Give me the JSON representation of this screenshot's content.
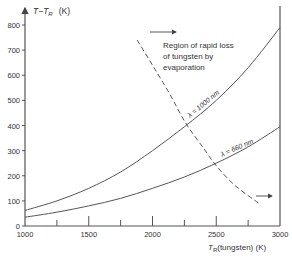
{
  "chart_data": {
    "type": "line",
    "title": "",
    "xlabel": "T_R (tungsten) (K)",
    "ylabel": "T − T_R (K)",
    "xlim": [
      1000,
      3000
    ],
    "ylim": [
      0,
      850
    ],
    "x_ticks": [
      1000,
      1500,
      2000,
      2500,
      3000
    ],
    "x_minor_ticks": [
      1250,
      1750,
      2250,
      2750
    ],
    "y_ticks": [
      0,
      100,
      200,
      300,
      400,
      500,
      600,
      700,
      800
    ],
    "grid": false,
    "series": [
      {
        "name": "λ = 1000 nm",
        "style": "solid",
        "x": [
          1000,
          1250,
          1500,
          1750,
          2000,
          2250,
          2500,
          2750,
          3000
        ],
        "y": [
          62,
          100,
          150,
          215,
          300,
          395,
          500,
          630,
          790
        ]
      },
      {
        "name": "λ = 660 nm",
        "style": "solid",
        "x": [
          1000,
          1250,
          1500,
          1750,
          2000,
          2250,
          2500,
          2750,
          3000
        ],
        "y": [
          35,
          55,
          80,
          110,
          150,
          195,
          250,
          315,
          395
        ]
      },
      {
        "name": "evaporation boundary",
        "style": "dashed",
        "x": [
          1880,
          2000,
          2130,
          2260,
          2400,
          2500,
          2650,
          2850
        ],
        "y": [
          740,
          640,
          530,
          410,
          310,
          240,
          160,
          85
        ]
      }
    ],
    "annotations": [
      {
        "text": "Region of rapid loss of tungsten by evaporation",
        "arrow": "right"
      },
      {
        "text": "λ = 1000 nm",
        "on_series": 0
      },
      {
        "text": "λ = 660 nm",
        "on_series": 1
      }
    ]
  },
  "labels": {
    "y_axis_title": "T−T",
    "y_axis_sub": "R",
    "y_axis_unit": "(K)",
    "x_axis_title": "T",
    "x_axis_sub": "R",
    "x_axis_rest": "(tungsten)  (K)",
    "region_line1": "Region of rapid loss",
    "region_line2": "of tungsten by",
    "region_line3": "evaporation",
    "curve1_label": "λ = 1000 nm",
    "curve2_label": "λ = 660 nm",
    "x_tick_labels": [
      "1000",
      "1500",
      "2000",
      "2500",
      "3000"
    ],
    "y_tick_labels": [
      "0",
      "100",
      "200",
      "300",
      "400",
      "500",
      "600",
      "700",
      "800"
    ]
  }
}
